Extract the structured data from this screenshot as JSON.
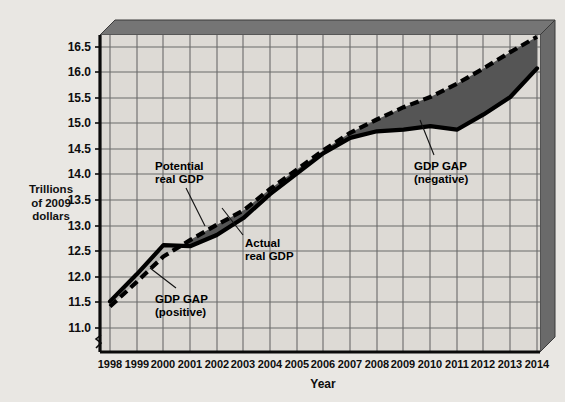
{
  "figure": {
    "background_color": "#e9e7e3",
    "plot_fill": "#dddad5",
    "frame_3d_color": "#6e6e6e",
    "frame_3d_top_color": "#757575",
    "axis_break_label": "axis-break"
  },
  "chart_data": {
    "type": "line",
    "title": "",
    "xlabel": "Year",
    "ylabel": "Trillions of 2009 dollars",
    "ylabel_lines": [
      "Trillions",
      "of 2009",
      "dollars"
    ],
    "grid": true,
    "legend_position": "inline-annotations",
    "xlim": [
      1998,
      2014
    ],
    "ylim": [
      11.0,
      16.75
    ],
    "y_ticks": [
      11.0,
      11.5,
      12.0,
      12.5,
      13.0,
      13.5,
      14.0,
      14.5,
      15.0,
      15.5,
      16.0,
      16.5
    ],
    "y_tick_labels": [
      "11.0",
      "11.5",
      "12.0",
      "12.5",
      "13.0",
      "13.5",
      "14.0",
      "14.5",
      "15.0",
      "15.5",
      "16.0",
      "16.5"
    ],
    "x_ticks": [
      1998,
      1999,
      2000,
      2001,
      2002,
      2003,
      2004,
      2005,
      2006,
      2007,
      2008,
      2009,
      2010,
      2011,
      2012,
      2013,
      2014
    ],
    "x_tick_labels": [
      "1998",
      "1999",
      "2000",
      "2001",
      "2002",
      "2003",
      "2004",
      "2005",
      "2006",
      "2007",
      "2008",
      "2009",
      "2010",
      "2011",
      "2012",
      "2013",
      "2014"
    ],
    "x": [
      1998,
      1999,
      2000,
      2001,
      2002,
      2003,
      2004,
      2005,
      2006,
      2007,
      2008,
      2009,
      2010,
      2011,
      2012,
      2013,
      2014
    ],
    "series": [
      {
        "name": "Actual real GDP",
        "style": "solid-thick-black",
        "color": "#000000",
        "values": [
          11.52,
          12.05,
          12.62,
          12.6,
          12.82,
          13.15,
          13.62,
          14.02,
          14.42,
          14.72,
          14.85,
          14.88,
          14.95,
          14.88,
          15.18,
          15.52,
          16.08
        ]
      },
      {
        "name": "Potential real GDP",
        "style": "dashed-thick-black",
        "color": "#000000",
        "values": [
          11.42,
          11.9,
          12.4,
          12.72,
          13.02,
          13.3,
          13.72,
          14.1,
          14.48,
          14.82,
          15.08,
          15.32,
          15.52,
          15.78,
          16.08,
          16.4,
          16.7
        ]
      }
    ],
    "fills": [
      {
        "name": "GDP GAP (positive)",
        "color": "#b6b5b1",
        "description": "Region where actual real GDP exceeds potential real GDP, 1998-2001"
      },
      {
        "name": "GDP GAP (negative)",
        "color": "#555555",
        "description": "Region where potential real GDP exceeds actual real GDP, 2001-2014"
      }
    ],
    "annotations": [
      {
        "id": "potential-real-gdp",
        "lines": [
          "Potential",
          "real GDP"
        ],
        "text": "Potential real GDP",
        "x": 155,
        "y": 160
      },
      {
        "id": "actual-real-gdp",
        "lines": [
          "Actual",
          "real GDP"
        ],
        "text": "Actual real GDP",
        "x": 245,
        "y": 237
      },
      {
        "id": "gdp-gap-positive",
        "lines": [
          "GDP GAP",
          "(positive)"
        ],
        "text": "GDP GAP (positive)",
        "x": 155,
        "y": 293
      },
      {
        "id": "gdp-gap-negative",
        "lines": [
          "GDP GAP",
          "(negative)"
        ],
        "text": "GDP GAP (negative)",
        "x": 414,
        "y": 160
      }
    ]
  }
}
